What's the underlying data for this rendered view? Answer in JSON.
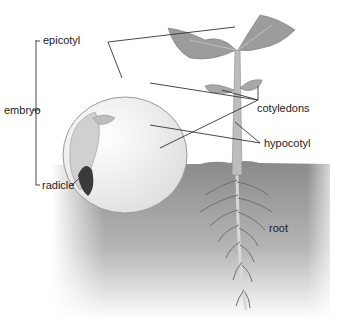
{
  "diagram": {
    "labels": {
      "epicotyl": "epicotyl",
      "embryo": "embryo",
      "radicle": "radicle",
      "cotyledons": "cotyledons",
      "hypocotyl": "hypocotyl",
      "root": "root"
    },
    "colors": {
      "leaf": "#9a9a9a",
      "stem": "#b8b8b8",
      "soil_top": "#8e8e8e",
      "soil_fade": "#ffffff",
      "seed": "#f4f4f4",
      "line": "#333333"
    }
  }
}
